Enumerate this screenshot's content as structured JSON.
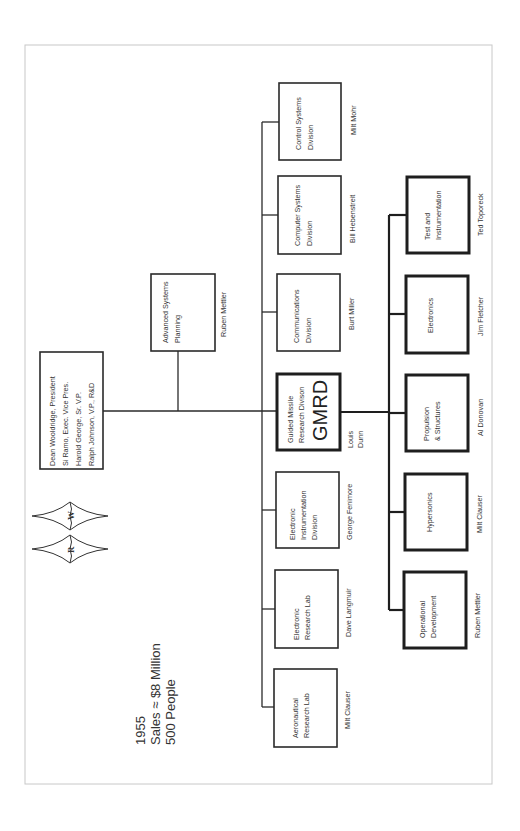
{
  "chart_title": "TRW (Ramo-Wooldridge) Organization Chart 1955",
  "logo": {
    "letters": [
      "R",
      "W"
    ]
  },
  "stats": {
    "year": "1955",
    "sales": "Sales ≈ $8 Million",
    "people": "500 People"
  },
  "executive": {
    "lines": [
      "Dean Wooldridge, President",
      "Si Ramo, Exec. Vice Pres.",
      "Harold George, Sr. V.P.",
      "Ralph Johnson, V.P., R&D"
    ]
  },
  "staff": {
    "title_lines": [
      "Advanced Systems",
      "Planning"
    ],
    "head": "Ruben Mettler"
  },
  "divisions": [
    {
      "id": "control",
      "title_lines": [
        "Control Systems",
        "Division"
      ],
      "head_lines": [
        "Milt Mohr"
      ]
    },
    {
      "id": "computer",
      "title_lines": [
        "Computer Systems",
        "Division"
      ],
      "head_lines": [
        "Bill Hebenstreit"
      ]
    },
    {
      "id": "communications",
      "title_lines": [
        "Communications",
        "Division"
      ],
      "head_lines": [
        "Burt Miller"
      ]
    },
    {
      "id": "gmrd",
      "title_lines": [
        "Guided Missile",
        "Research Divison"
      ],
      "abbr": "GMRD",
      "head_lines": [
        "Louis",
        "Dunn"
      ]
    },
    {
      "id": "electronic-instrumentation",
      "title_lines": [
        "Electronic",
        "Instrumentation",
        "Division"
      ],
      "head_lines": [
        "George Fenimore"
      ]
    },
    {
      "id": "electronic-research",
      "title_lines": [
        "Electronic",
        "Research Lab"
      ],
      "head_lines": [
        "Dave Langmuir"
      ]
    },
    {
      "id": "aeronautical-research",
      "title_lines": [
        "Aeronautical",
        "Research Lab"
      ],
      "head_lines": [
        "Milt Clauser"
      ]
    }
  ],
  "gmrd_departments": [
    {
      "id": "test-instrumentation",
      "title_lines": [
        "Test and",
        "Instrumentation"
      ],
      "head": "Ted Toporeck"
    },
    {
      "id": "electronics",
      "title_lines": [
        "Electronics"
      ],
      "head": "Jim Fletcher"
    },
    {
      "id": "propulsion-structures",
      "title_lines": [
        "Propulsion",
        "& Structures"
      ],
      "head": "Al Donovan"
    },
    {
      "id": "hypersonics",
      "title_lines": [
        "Hypersonics"
      ],
      "head": "Milt Clauser"
    },
    {
      "id": "operational-development",
      "title_lines": [
        "Operational",
        "Development"
      ],
      "head": "Ruben Mettler"
    }
  ]
}
